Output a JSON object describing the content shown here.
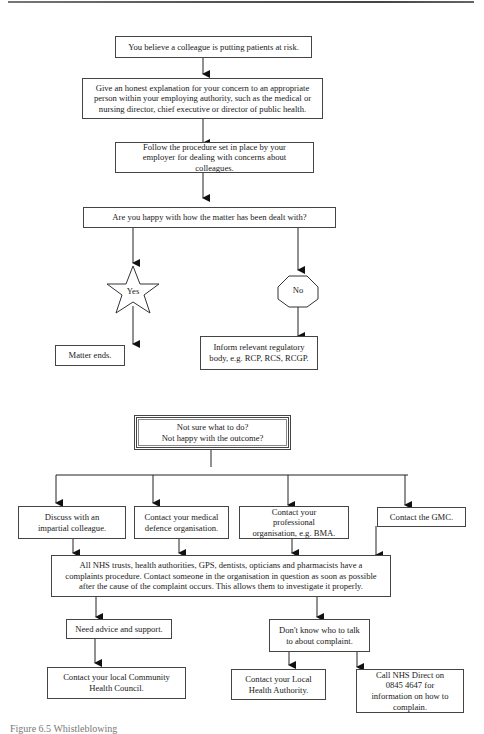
{
  "section1": {
    "start": "You believe a colleague is putting patients at risk.",
    "explain": "Give an honest explanation for your concern to an appropriate person within your employing authority, such as the medical or nursing director, chief executive or director of public health.",
    "follow_procedure": "Follow the procedure set in place by your employer for dealing with concerns about colleagues.",
    "question": "Are you happy with how the matter has been dealt with?",
    "yes_label": "Yes",
    "no_label": "No",
    "yes_outcome": "Matter ends.",
    "no_outcome": "Inform relevant regulatory body, e.g. RCP, RCS, RCGP."
  },
  "section2": {
    "header_line1": "Not sure what to do?",
    "header_line2": "Not happy with the outcome?",
    "options": [
      "Discuss with an impartial colleague.",
      "Contact your medical defence organisation.",
      "Contact your professional organisation, e.g. BMA.",
      "Contact the GMC."
    ],
    "complaints_procedure": "All NHS trusts, health authorities, GPS, dentists, opticians and pharmacists have a complaints procedure.  Contact someone in the organisation in question as soon as possible after the cause of the complaint occurs.  This allows them to investigate it properly.",
    "need_advice": "Need advice and support.",
    "dont_know": "Don't know who to talk to about complaint.",
    "community_health": "Contact your local Community Health Council.",
    "local_authority": "Contact your Local Health Authority.",
    "nhs_direct": "Call NHS Direct on 0845 4647 for information on how to complain."
  },
  "caption": "Figure 6.5  Whistleblowing"
}
